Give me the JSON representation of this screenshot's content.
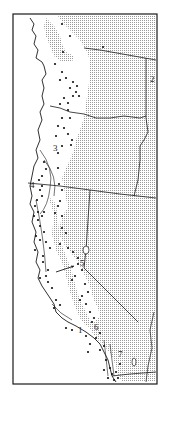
{
  "map": {
    "description": "Distribution map, Pacific coast of western North America",
    "colors": {
      "paper": "#ffffff",
      "ink": "#1a1a1a",
      "stipple": "#9a9a9a"
    },
    "labels": [
      {
        "id": "1",
        "text": "1",
        "x": 78,
        "y": 333
      },
      {
        "id": "2",
        "text": "2",
        "x": 150,
        "y": 82
      },
      {
        "id": "3",
        "text": "3",
        "x": 53,
        "y": 151
      },
      {
        "id": "4",
        "text": "4",
        "x": 30,
        "y": 188
      },
      {
        "id": "5",
        "text": "5",
        "x": 80,
        "y": 266
      },
      {
        "id": "6",
        "text": "6",
        "x": 94,
        "y": 330
      },
      {
        "id": "7",
        "text": "7",
        "x": 118,
        "y": 357
      }
    ],
    "points": [
      [
        62,
        24
      ],
      [
        70,
        36
      ],
      [
        63,
        52
      ],
      [
        103,
        47
      ],
      [
        55,
        64
      ],
      [
        62,
        72
      ],
      [
        60,
        80
      ],
      [
        66,
        78
      ],
      [
        73,
        82
      ],
      [
        70,
        88
      ],
      [
        77,
        86
      ],
      [
        76,
        92
      ],
      [
        73,
        96
      ],
      [
        79,
        96
      ],
      [
        64,
        98
      ],
      [
        68,
        103
      ],
      [
        60,
        104
      ],
      [
        68,
        110
      ],
      [
        70,
        118
      ],
      [
        62,
        118
      ],
      [
        58,
        126
      ],
      [
        64,
        128
      ],
      [
        56,
        136
      ],
      [
        68,
        134
      ],
      [
        72,
        140
      ],
      [
        62,
        146
      ],
      [
        58,
        153
      ],
      [
        71,
        145
      ],
      [
        44,
        162
      ],
      [
        46,
        169
      ],
      [
        58,
        168
      ],
      [
        42,
        176
      ],
      [
        39,
        180
      ],
      [
        42,
        186
      ],
      [
        40,
        190
      ],
      [
        42,
        196
      ],
      [
        37,
        200
      ],
      [
        59,
        184
      ],
      [
        62,
        190
      ],
      [
        60,
        201
      ],
      [
        58,
        206
      ],
      [
        35,
        206
      ],
      [
        38,
        212
      ],
      [
        34,
        216
      ],
      [
        38,
        220
      ],
      [
        42,
        216
      ],
      [
        44,
        212
      ],
      [
        55,
        213
      ],
      [
        62,
        216
      ],
      [
        40,
        226
      ],
      [
        44,
        232
      ],
      [
        36,
        236
      ],
      [
        40,
        240
      ],
      [
        46,
        242
      ],
      [
        50,
        248
      ],
      [
        35,
        250
      ],
      [
        43,
        256
      ],
      [
        62,
        228
      ],
      [
        66,
        233
      ],
      [
        60,
        244
      ],
      [
        68,
        248
      ],
      [
        73,
        252
      ],
      [
        78,
        258
      ],
      [
        43,
        262
      ],
      [
        48,
        270
      ],
      [
        46,
        276
      ],
      [
        48,
        282
      ],
      [
        52,
        288
      ],
      [
        40,
        278
      ],
      [
        78,
        264
      ],
      [
        82,
        270
      ],
      [
        75,
        276
      ],
      [
        72,
        280
      ],
      [
        85,
        284
      ],
      [
        88,
        292
      ],
      [
        82,
        296
      ],
      [
        80,
        300
      ],
      [
        86,
        304
      ],
      [
        56,
        300
      ],
      [
        60,
        305
      ],
      [
        54,
        308
      ],
      [
        90,
        312
      ],
      [
        94,
        318
      ],
      [
        92,
        322
      ],
      [
        66,
        328
      ],
      [
        72,
        330
      ],
      [
        86,
        336
      ],
      [
        90,
        344
      ],
      [
        96,
        338
      ],
      [
        100,
        333
      ],
      [
        88,
        352
      ],
      [
        100,
        350
      ],
      [
        104,
        346
      ],
      [
        106,
        360
      ],
      [
        110,
        368
      ],
      [
        112,
        374
      ],
      [
        104,
        370
      ],
      [
        116,
        372
      ],
      [
        114,
        380
      ],
      [
        118,
        378
      ],
      [
        108,
        378
      ],
      [
        120,
        364
      ]
    ],
    "arrow": {
      "from": [
        56,
        272
      ],
      "to": [
        74,
        266
      ]
    }
  }
}
